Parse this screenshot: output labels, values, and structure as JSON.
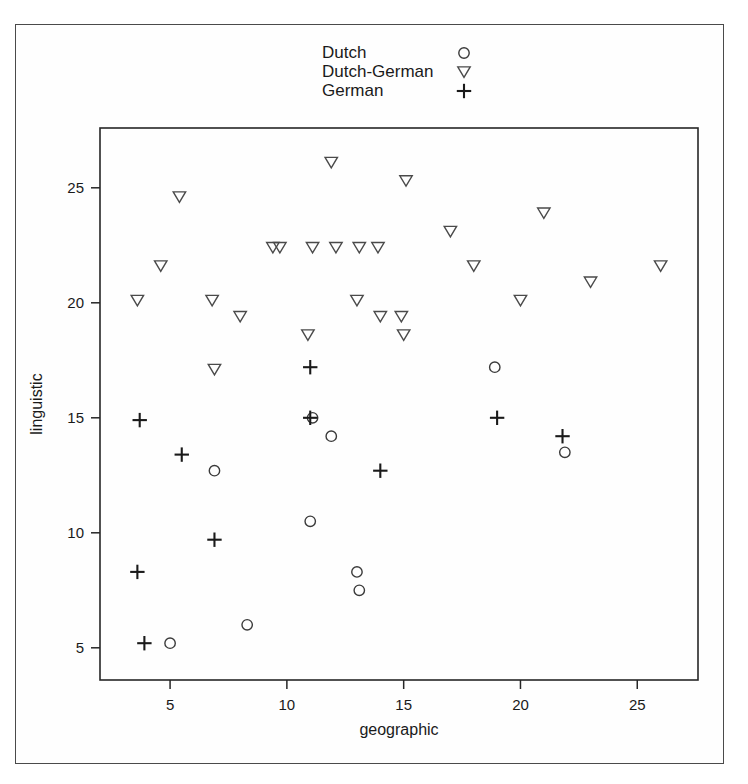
{
  "figure": {
    "axes": {
      "x": {
        "label": "geographic",
        "ticks": [
          5,
          10,
          15,
          20,
          25
        ],
        "tick_labels": [
          "5",
          "10",
          "15",
          "20",
          "25"
        ],
        "min": 2.0,
        "max": 27.6
      },
      "y": {
        "label": "linguistic",
        "ticks": [
          5,
          10,
          15,
          20,
          25
        ],
        "tick_labels": [
          "5",
          "10",
          "15",
          "20",
          "25"
        ],
        "min": 3.6,
        "max": 27.6
      }
    },
    "legend": {
      "position": "top-center",
      "entries": [
        {
          "label": "Dutch",
          "marker": "circle-icon"
        },
        {
          "label": "Dutch-German",
          "marker": "triangle-down-icon"
        },
        {
          "label": "German",
          "marker": "plus-icon"
        }
      ]
    },
    "colors": {
      "marker_circle": "#3a3a3a",
      "marker_triangle": "#4a4a4a",
      "marker_plus": "#1a1a1a",
      "axis": "#262626",
      "frame": "#4a4a4a",
      "background": "#ffffff"
    }
  },
  "chart_data": {
    "type": "scatter",
    "title": "",
    "xlabel": "geographic",
    "ylabel": "linguistic",
    "xlim": [
      2.0,
      27.6
    ],
    "ylim": [
      3.6,
      27.6
    ],
    "grid": false,
    "legend_position": "top-center",
    "series": [
      {
        "name": "Dutch",
        "marker": "circle",
        "points": [
          [
            5.0,
            5.2
          ],
          [
            6.9,
            12.7
          ],
          [
            8.3,
            6.0
          ],
          [
            11.0,
            10.5
          ],
          [
            11.1,
            15.0
          ],
          [
            11.9,
            14.2
          ],
          [
            13.0,
            8.3
          ],
          [
            13.1,
            7.5
          ],
          [
            18.9,
            17.2
          ],
          [
            21.9,
            13.5
          ]
        ]
      },
      {
        "name": "Dutch-German",
        "marker": "triangle-down",
        "points": [
          [
            3.6,
            20.1
          ],
          [
            4.6,
            21.6
          ],
          [
            5.4,
            24.6
          ],
          [
            6.8,
            20.1
          ],
          [
            6.9,
            17.1
          ],
          [
            8.0,
            19.4
          ],
          [
            9.4,
            22.4
          ],
          [
            9.7,
            22.4
          ],
          [
            10.9,
            18.6
          ],
          [
            11.1,
            22.4
          ],
          [
            11.9,
            26.1
          ],
          [
            12.1,
            22.4
          ],
          [
            13.0,
            20.1
          ],
          [
            13.1,
            22.4
          ],
          [
            13.9,
            22.4
          ],
          [
            14.0,
            19.4
          ],
          [
            14.9,
            19.4
          ],
          [
            15.0,
            18.6
          ],
          [
            15.1,
            25.3
          ],
          [
            17.0,
            23.1
          ],
          [
            18.0,
            21.6
          ],
          [
            20.0,
            20.1
          ],
          [
            21.0,
            23.9
          ],
          [
            23.0,
            20.9
          ],
          [
            26.0,
            21.6
          ]
        ]
      },
      {
        "name": "German",
        "marker": "plus",
        "points": [
          [
            3.6,
            8.3
          ],
          [
            3.7,
            14.9
          ],
          [
            3.9,
            5.2
          ],
          [
            5.5,
            13.4
          ],
          [
            6.9,
            9.7
          ],
          [
            11.0,
            15.0
          ],
          [
            11.0,
            17.2
          ],
          [
            14.0,
            12.7
          ],
          [
            19.0,
            15.0
          ],
          [
            21.8,
            14.2
          ]
        ]
      }
    ]
  }
}
